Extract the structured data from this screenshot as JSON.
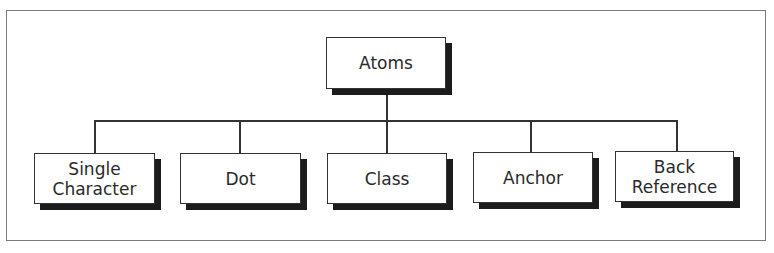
{
  "diagram": {
    "type": "tree",
    "root": {
      "label": "Atoms"
    },
    "children": [
      {
        "label": "Single\nCharacter"
      },
      {
        "label": "Dot"
      },
      {
        "label": "Class"
      },
      {
        "label": "Anchor"
      },
      {
        "label": "Back\nReference"
      }
    ]
  },
  "colors": {
    "border": "#333333",
    "shadow": "#1c1c1c",
    "frame": "#7a7a7a",
    "background": "#ffffff"
  }
}
